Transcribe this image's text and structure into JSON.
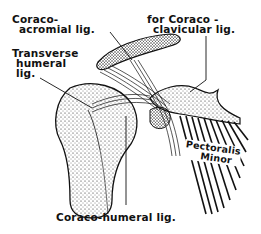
{
  "figure": {
    "labels": {
      "coraco_acromial": [
        "Coraco-",
        "acromial lig."
      ],
      "transverse_humeral": [
        "Transverse",
        "humeral",
        "lig."
      ],
      "coraco_clavicular": [
        "for Coraco -",
        "clavicular lig."
      ],
      "pectoralis_minor": [
        "Pectoralis",
        "Minor"
      ],
      "coraco_humeral": [
        "Coraco-humeral lig."
      ]
    },
    "colors": {
      "ink": "#111111",
      "background": "#ffffff"
    }
  }
}
